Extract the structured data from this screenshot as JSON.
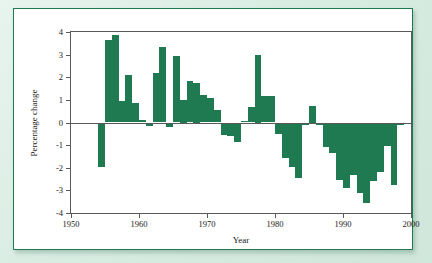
{
  "figure": {
    "accent_color": "#1f7a52",
    "axis_color": "#58595b",
    "card_background": "#ffffff",
    "page_background": "#dfeee6"
  },
  "chart_data": {
    "type": "bar",
    "title": "",
    "xlabel": "Year",
    "ylabel": "Percentage change",
    "xlim": [
      1950,
      2000
    ],
    "ylim": [
      -4,
      4
    ],
    "grid": false,
    "legend": null,
    "xticks": [
      1950,
      1960,
      1970,
      1980,
      1990,
      2000
    ],
    "xtick_labels": [
      "1950",
      "1960",
      "1970",
      "1980",
      "1990",
      "2000"
    ],
    "yticks": [
      4,
      3,
      2,
      1,
      0,
      -1,
      -2,
      -3,
      -4
    ],
    "ytick_labels": [
      "4",
      "3",
      "2",
      "1",
      "0",
      "-1",
      "-2",
      "-3",
      "-4"
    ],
    "x": [
      1954,
      1955,
      1956,
      1957,
      1958,
      1959,
      1960,
      1961,
      1962,
      1963,
      1964,
      1965,
      1966,
      1967,
      1968,
      1969,
      1970,
      1971,
      1972,
      1973,
      1974,
      1975,
      1976,
      1977,
      1978,
      1979,
      1980,
      1981,
      1982,
      1983,
      1984,
      1985,
      1986,
      1987,
      1988,
      1989,
      1990,
      1991,
      1992,
      1993,
      1994,
      1995,
      1996,
      1997,
      1998
    ],
    "values": [
      -1.95,
      3.65,
      3.85,
      0.95,
      2.1,
      0.85,
      0.1,
      -0.15,
      2.2,
      3.35,
      -0.2,
      2.95,
      1.0,
      1.85,
      1.75,
      1.2,
      1.1,
      0.55,
      -0.55,
      -0.6,
      -0.85,
      0.05,
      0.7,
      3.0,
      1.15,
      1.15,
      -0.5,
      -1.55,
      -1.95,
      -2.45,
      -0.1,
      0.75,
      -0.1,
      -1.1,
      -1.35,
      -2.55,
      -2.9,
      -2.3,
      -3.1,
      -3.55,
      -2.6,
      -2.2,
      -1.05,
      -2.75,
      -0.1
    ],
    "bar_color": "#1f7a52"
  }
}
